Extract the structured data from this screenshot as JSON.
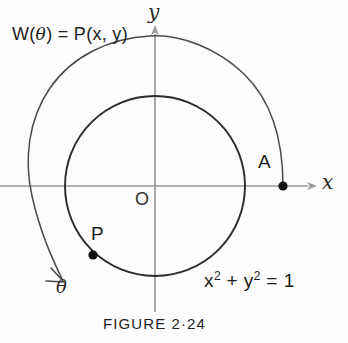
{
  "figure": {
    "caption": "FIGURE 2·24",
    "background_color": "#fdfdfd",
    "ink_color": "#1a1a1a"
  },
  "labels": {
    "winding": {
      "prefix": "W(",
      "theta": "θ",
      "suffix": ") = P(x, y)",
      "full_text": "W(θ) = P(x, y)"
    },
    "axis_y": "y",
    "axis_x": "x",
    "point_a": "A",
    "point_p": "P",
    "origin": "O",
    "angle": "θ",
    "equation_parts": {
      "x": "x",
      "exp1": "2",
      "plus": " + ",
      "y": "y",
      "exp2": "2",
      "equals": " = 1"
    },
    "equation_full": "x² + y² = 1"
  },
  "geometry": {
    "center_x": 155,
    "center_y": 186,
    "unit_circle_radius": 90,
    "spiral_outer_radius": 123,
    "point_a_x": 283,
    "point_a_y": 186,
    "point_p_x": 93,
    "point_p_y": 255,
    "axis_color": "#9a9a9a",
    "circle_color": "#2b2b2b",
    "spiral_color": "#4a4a4a",
    "dot_color": "#111111"
  }
}
